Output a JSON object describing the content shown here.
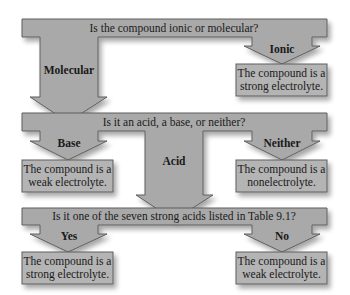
{
  "diagram": {
    "type": "flowchart",
    "colors": {
      "shape_fill": "#a9a9a9",
      "box_fill": "#b4b4b4",
      "stroke": "#5e5e5e",
      "text": "#1a1a1a",
      "background": "#ffffff"
    },
    "level1": {
      "question": "Is the compound ionic or molecular?",
      "branches": {
        "molecular": {
          "label": "Molecular"
        },
        "ionic": {
          "label": "Ionic",
          "result_line1": "The compound is a",
          "result_line2": "strong electrolyte."
        }
      }
    },
    "level2": {
      "question": "Is it an acid, a base, or neither?",
      "branches": {
        "base": {
          "label": "Base",
          "result_line1": "The compound is a",
          "result_line2": "weak electrolyte."
        },
        "acid": {
          "label": "Acid"
        },
        "neither": {
          "label": "Neither",
          "result_line1": "The compound is a",
          "result_line2": "nonelectrolyte."
        }
      }
    },
    "level3": {
      "question": "Is it one of the seven strong acids listed in Table 9.1?",
      "branches": {
        "yes": {
          "label": "Yes",
          "result_line1": "The compound is a",
          "result_line2": "strong electrolyte."
        },
        "no": {
          "label": "No",
          "result_line1": "The compound is a",
          "result_line2": "weak electrolyte."
        }
      }
    }
  }
}
